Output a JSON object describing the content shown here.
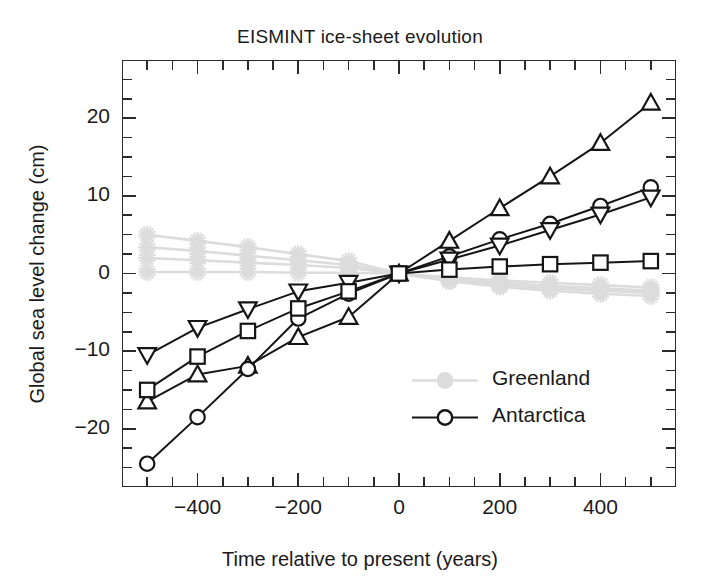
{
  "chart_data": {
    "type": "line",
    "title": "EISMINT ice-sheet evolution",
    "xlabel": "Time relative to present (years)",
    "ylabel": "Global sea level change  (cm)",
    "xlim": [
      -550,
      550
    ],
    "ylim": [
      -27.5,
      27.5
    ],
    "xticks": [
      -400,
      -200,
      0,
      200,
      400
    ],
    "xtick_labels": [
      "−400",
      "−200",
      "0",
      "200",
      "400"
    ],
    "xticks_minor": [
      -500,
      -450,
      -350,
      -300,
      -250,
      -150,
      -100,
      -50,
      50,
      100,
      150,
      250,
      300,
      350,
      450,
      500
    ],
    "yticks": [
      -20,
      -10,
      0,
      10,
      20
    ],
    "ytick_labels": [
      "−20",
      "−10",
      "0",
      "10",
      "20"
    ],
    "yticks_minor": [
      -25,
      -22.5,
      -17.5,
      -15,
      -12.5,
      -7.5,
      -5,
      -2.5,
      2.5,
      5,
      7.5,
      12.5,
      15,
      17.5,
      22.5,
      25
    ],
    "grid": false,
    "legend_position": "lower-right-inside",
    "x": [
      -500,
      -400,
      -300,
      -200,
      -100,
      0,
      100,
      200,
      300,
      400,
      500
    ],
    "groups": [
      {
        "name": "Greenland",
        "color": "#dcdcdc",
        "marker": "star-filled",
        "legend_marker": "circle-filled",
        "series": [
          {
            "name": "Greenland model 1",
            "marker": "star-filled",
            "values": [
              5.0,
              4.2,
              3.4,
              2.5,
              1.6,
              0.0,
              -0.5,
              -0.9,
              -1.2,
              -1.5,
              -1.8
            ]
          },
          {
            "name": "Greenland model 2",
            "marker": "star-filled",
            "values": [
              3.4,
              2.9,
              2.3,
              1.7,
              1.1,
              0.0,
              -0.7,
              -1.2,
              -1.6,
              -1.9,
              -2.2
            ]
          },
          {
            "name": "Greenland model 3",
            "marker": "star-filled",
            "values": [
              2.0,
              1.7,
              1.4,
              1.1,
              0.7,
              0.0,
              -0.9,
              -1.5,
              -1.9,
              -2.2,
              -2.5
            ]
          },
          {
            "name": "Greenland model 4",
            "marker": "star-filled",
            "values": [
              0.2,
              0.2,
              0.2,
              0.1,
              0.1,
              0.0,
              -1.0,
              -1.7,
              -2.2,
              -2.6,
              -2.9
            ]
          }
        ]
      },
      {
        "name": "Antarctica",
        "color": "#151515",
        "marker": "circle-open",
        "legend_marker": "circle-open",
        "series": [
          {
            "name": "Antarctica triangle-up",
            "marker": "triangle-up",
            "values": [
              -16.5,
              -13.0,
              -11.9,
              -8.2,
              -5.6,
              0.0,
              4.2,
              8.4,
              12.5,
              16.8,
              22.0
            ]
          },
          {
            "name": "Antarctica circle",
            "marker": "circle-open",
            "values": [
              -24.5,
              -18.5,
              -12.3,
              -5.8,
              -2.6,
              0.0,
              2.2,
              4.4,
              6.4,
              8.7,
              11.1
            ]
          },
          {
            "name": "Antarctica triangle-down",
            "marker": "triangle-down",
            "values": [
              -10.5,
              -7.0,
              -4.6,
              -2.3,
              -1.2,
              0.0,
              1.8,
              3.6,
              5.6,
              7.6,
              9.8
            ]
          },
          {
            "name": "Antarctica square",
            "marker": "square-open",
            "values": [
              -15.0,
              -10.7,
              -7.4,
              -4.5,
              -2.3,
              0.0,
              0.5,
              0.9,
              1.2,
              1.4,
              1.6
            ]
          }
        ]
      }
    ],
    "legend_entries": [
      {
        "label": "Greenland",
        "color": "#dcdcdc",
        "marker": "circle-filled"
      },
      {
        "label": "Antarctica",
        "color": "#151515",
        "marker": "circle-open"
      }
    ]
  }
}
